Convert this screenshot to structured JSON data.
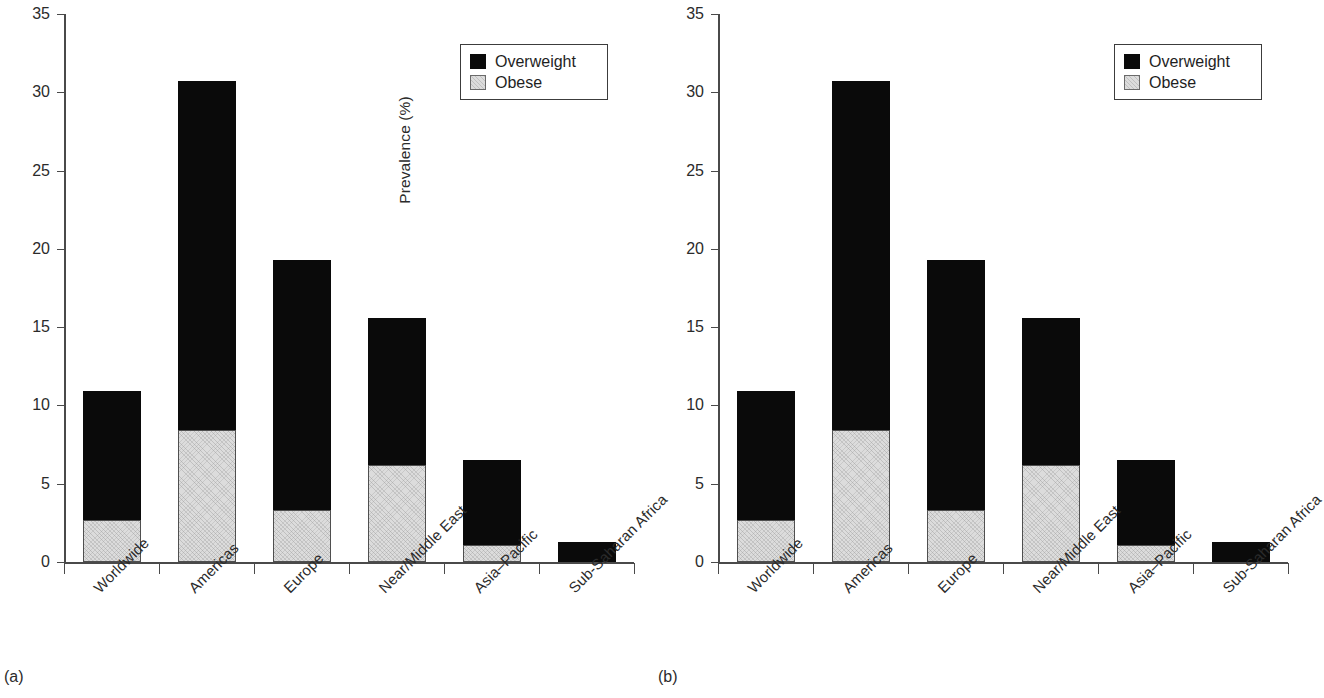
{
  "figure": {
    "panels": [
      {
        "caption": "(a)"
      },
      {
        "caption": "(b)"
      }
    ]
  },
  "legend": {
    "entries": [
      {
        "label": "Overweight",
        "color": "#0a0a0a"
      },
      {
        "label": "Obese",
        "color": "#dcdcdc"
      }
    ]
  },
  "axis": {
    "ylabel": "Prevalence (%)",
    "yticks": [
      "0",
      "5",
      "10",
      "15",
      "20",
      "25",
      "30",
      "35"
    ]
  },
  "chart_data": {
    "type": "bar",
    "title": "",
    "subtitle": "",
    "xlabel": "",
    "ylabel": "Prevalence (%)",
    "ylim": [
      0,
      35
    ],
    "ytick_values": [
      0,
      5,
      10,
      15,
      20,
      25,
      30,
      35
    ],
    "grid": false,
    "stacked": true,
    "legend_position": "top-right",
    "panel_captions": [
      "(a)",
      "(b)"
    ],
    "note": "Panels (a) and (b) show identical data.",
    "categories": [
      "Worldwide",
      "Americas",
      "Europe",
      "Near/Middle East",
      "Asia–Pacific",
      "Sub-Saharan Africa"
    ],
    "series": [
      {
        "name": "Obese",
        "color": "#dcdcdc",
        "values": [
          2.7,
          8.4,
          3.35,
          6.2,
          1.1,
          0.0
        ]
      },
      {
        "name": "Overweight",
        "color": "#0a0a0a",
        "values": [
          8.2,
          22.3,
          15.95,
          9.4,
          5.4,
          1.3
        ]
      }
    ],
    "totals": [
      10.9,
      30.7,
      19.3,
      15.6,
      6.5,
      1.3
    ]
  }
}
